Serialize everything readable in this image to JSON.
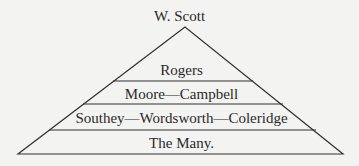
{
  "diagram": {
    "type": "pyramid",
    "apex_label": "W. Scott",
    "tiers": [
      {
        "label": "Rogers"
      },
      {
        "label": "Moore—Campbell"
      },
      {
        "label": "Southey—Wordsworth—Coleridge"
      },
      {
        "label": "The Many."
      }
    ],
    "line_color": "#333333",
    "background": "#f3f3f1"
  }
}
